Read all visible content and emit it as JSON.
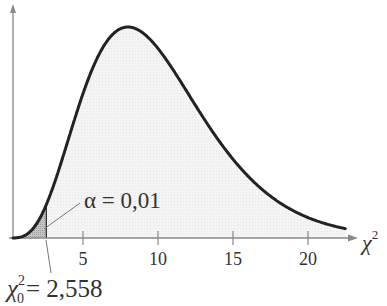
{
  "chart_data": {
    "type": "area",
    "title": "",
    "distribution": "chi-square",
    "degrees_of_freedom": 10,
    "xlabel": "χ²",
    "ylabel": "",
    "x_ticks": [
      5,
      10,
      15,
      20
    ],
    "x_tick_labels": [
      "5",
      "10",
      "15",
      "20"
    ],
    "xlim": [
      0,
      23
    ],
    "grid": false,
    "legend": "none",
    "shaded_region": {
      "from": 0,
      "to": 2.558,
      "label": "α = 0,01"
    },
    "critical_value": {
      "value": 2.558,
      "label": "χ₀² = 2,558"
    },
    "annotations": [
      "α = 0,01",
      "χ₀² = 2,558"
    ]
  },
  "labels": {
    "alpha": "α = 0,01",
    "chi_axis_base": "χ",
    "chi_axis_sup": "2",
    "crit_base": "χ",
    "crit_sub": "0",
    "crit_sup": "2",
    "crit_value": "= 2,558",
    "tick5": "5",
    "tick10": "10",
    "tick15": "15",
    "tick20": "20"
  },
  "colors": {
    "curve": "#222222",
    "axis": "#888888",
    "fill_light": "#f2f2f2",
    "fill_shaded": "#bdbdbd"
  }
}
